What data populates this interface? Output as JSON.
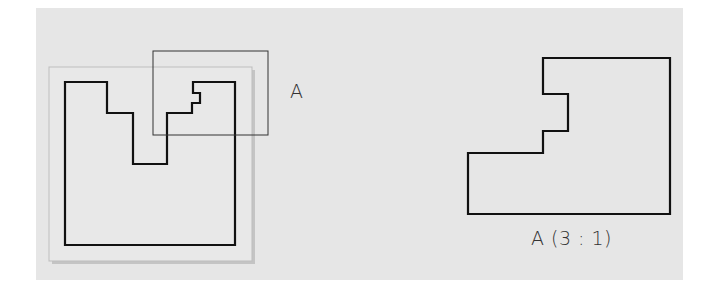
{
  "diagram": {
    "background_color": "#e6e6e6",
    "stroke_color": "#111111",
    "detail_label": "A",
    "detail_view_label": "A (3 : 1)",
    "main_view": {
      "sheet_rect": {
        "x": 49,
        "y": 67,
        "w": 203,
        "h": 194
      },
      "outline_points": "65,82 107,82 107,113 133,113 133,164 167,164 167,113 192,113 192,103 200,103 200,93 193,93 193,82 235,82 235,245 65,245"
    },
    "detail_rect": {
      "x": 153,
      "y": 51,
      "w": 115,
      "h": 84
    },
    "detail_view": {
      "outline_points": "543,58 670,58 670,214 468,214 468,153 543,153 543,131 568,131 568,94 543,94"
    }
  }
}
